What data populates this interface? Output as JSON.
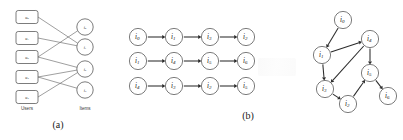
{
  "figure": {
    "caption_a": "(a)",
    "caption_b": "(b)"
  },
  "panel_a": {
    "column_labels": {
      "users": "Users",
      "items": "Items"
    },
    "user_nodes": [
      {
        "id": "u0",
        "base": "u",
        "sub": "0",
        "x": 27,
        "y": 17
      },
      {
        "id": "u1",
        "base": "u",
        "sub": "1",
        "x": 27,
        "y": 38
      },
      {
        "id": "u2",
        "base": "u",
        "sub": "2",
        "x": 27,
        "y": 57
      },
      {
        "id": "u3",
        "base": "u",
        "sub": "3",
        "x": 27,
        "y": 77
      },
      {
        "id": "u4",
        "base": "u",
        "sub": "4",
        "x": 27,
        "y": 97
      }
    ],
    "item_nodes": [
      {
        "id": "i0",
        "base": "i",
        "sub": "0",
        "x": 85,
        "y": 27
      },
      {
        "id": "i1",
        "base": "i",
        "sub": "1",
        "x": 85,
        "y": 47
      },
      {
        "id": "i2",
        "base": "i",
        "sub": "2",
        "x": 85,
        "y": 69
      },
      {
        "id": "i3",
        "base": "i",
        "sub": "3",
        "x": 85,
        "y": 90
      }
    ],
    "edges": [
      {
        "from": "u0",
        "to": "i1"
      },
      {
        "from": "u1",
        "to": "i1"
      },
      {
        "from": "u2",
        "to": "i0"
      },
      {
        "from": "u2",
        "to": "i2"
      },
      {
        "from": "u3",
        "to": "i2"
      },
      {
        "from": "u3",
        "to": "i3"
      },
      {
        "from": "u4",
        "to": "i2"
      }
    ]
  },
  "panel_b": {
    "sequences": [
      {
        "row": 1,
        "items": [
          {
            "base": "i",
            "sub": "0"
          },
          {
            "base": "i",
            "sub": "1"
          },
          {
            "base": "i",
            "sub": "3"
          },
          {
            "base": "i",
            "sub": "2"
          }
        ]
      },
      {
        "row": 2,
        "items": [
          {
            "base": "i",
            "sub": "1"
          },
          {
            "base": "i",
            "sub": "4"
          },
          {
            "base": "i",
            "sub": "5"
          },
          {
            "base": "i",
            "sub": "6"
          }
        ]
      },
      {
        "row": 3,
        "items": [
          {
            "base": "i",
            "sub": "4"
          },
          {
            "base": "i",
            "sub": "3"
          },
          {
            "base": "i",
            "sub": "2"
          },
          {
            "base": "i",
            "sub": "5"
          }
        ]
      }
    ],
    "graph": {
      "nodes": [
        {
          "id": "i0",
          "base": "i",
          "sub": "0",
          "x": 53,
          "y": 20
        },
        {
          "id": "i1",
          "base": "i",
          "sub": "1",
          "x": 32,
          "y": 55
        },
        {
          "id": "i4",
          "base": "i",
          "sub": "4",
          "x": 80,
          "y": 39
        },
        {
          "id": "i5",
          "base": "i",
          "sub": "5",
          "x": 80,
          "y": 73
        },
        {
          "id": "i3",
          "base": "i",
          "sub": "3",
          "x": 35,
          "y": 89
        },
        {
          "id": "i2",
          "base": "i",
          "sub": "2",
          "x": 58,
          "y": 104
        },
        {
          "id": "i6",
          "base": "i",
          "sub": "6",
          "x": 98,
          "y": 96
        }
      ],
      "edges": [
        {
          "from": "i0",
          "to": "i1"
        },
        {
          "from": "i1",
          "to": "i4"
        },
        {
          "from": "i1",
          "to": "i3"
        },
        {
          "from": "i4",
          "to": "i5"
        },
        {
          "from": "i4",
          "to": "i3"
        },
        {
          "from": "i3",
          "to": "i2"
        },
        {
          "from": "i2",
          "to": "i5"
        },
        {
          "from": "i5",
          "to": "i6"
        }
      ]
    }
  }
}
